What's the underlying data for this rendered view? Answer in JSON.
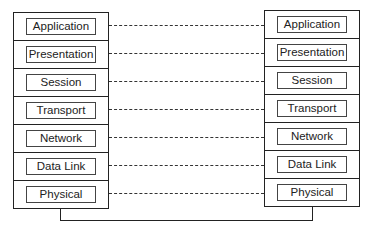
{
  "diagram": {
    "type": "osi-model-peer-communication",
    "left_stack": {
      "layers": [
        "Application",
        "Presentation",
        "Session",
        "Transport",
        "Network",
        "Data Link",
        "Physical"
      ]
    },
    "right_stack": {
      "layers": [
        "Application",
        "Presentation",
        "Session",
        "Transport",
        "Network",
        "Data Link",
        "Physical"
      ]
    },
    "connections": "dashed peer lines between matching layers; solid physical link below stacks"
  }
}
